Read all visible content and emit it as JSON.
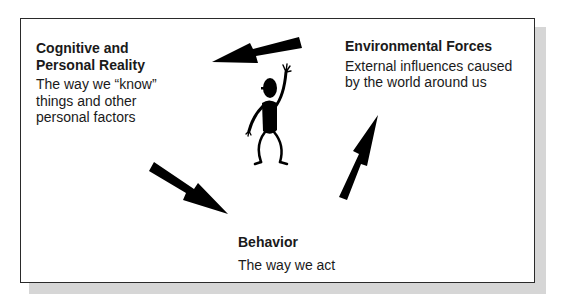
{
  "diagram": {
    "type": "triadic-reciprocal-model",
    "nodes": [
      {
        "id": "cognitive",
        "title": "Cognitive and\nPersonal Reality",
        "description": "The way we “know”\nthings and other\npersonal factors"
      },
      {
        "id": "environment",
        "title": "Environmental Forces",
        "description": "External influences caused\nby the world around us"
      },
      {
        "id": "behavior",
        "title": "Behavior",
        "description": "The way we act"
      }
    ],
    "edges": [
      {
        "from": "environment",
        "to": "cognitive",
        "label": ""
      },
      {
        "from": "cognitive",
        "to": "behavior",
        "label": ""
      },
      {
        "from": "behavior",
        "to": "environment",
        "label": ""
      }
    ],
    "center_figure": "stick-figure-waving",
    "colors": {
      "frame_border": "#2a2a2a",
      "shadow": "#d6d6d6",
      "arrow": "#000000",
      "text": "#1a1a1a"
    }
  }
}
